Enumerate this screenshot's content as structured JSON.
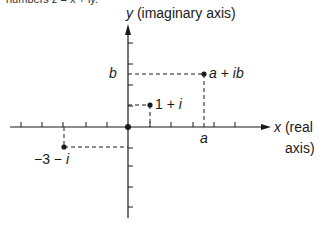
{
  "caption": "numbers z = x + iy.",
  "axes": {
    "y_label_var": "y",
    "y_label_text": " (imaginary axis)",
    "x_label_var": "x",
    "x_label_line1": " (real",
    "x_label_line2": "axis)"
  },
  "markers": {
    "a": "a",
    "b": "b"
  },
  "points": [
    {
      "name": "point-a-plus-ib",
      "label": "a + ib",
      "re": "a",
      "im": "b"
    },
    {
      "name": "point-1-plus-i",
      "label": "1 + i",
      "re": 1,
      "im": 1
    },
    {
      "name": "point-neg3-minus-i",
      "label": "−3 − i",
      "re": -3,
      "im": -1
    }
  ],
  "origin": {
    "re": 0,
    "im": 0
  },
  "colors": {
    "ink": "#1a1a1a",
    "background": "#ffffff"
  }
}
